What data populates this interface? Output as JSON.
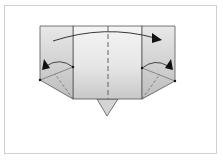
{
  "diagram": {
    "type": "origami-folding-step",
    "colors": {
      "frame": "#d0d0d0",
      "paper_light": "#f2f2f2",
      "paper_mid": "#d6d6d6",
      "paper_dark": "#c4c4c4",
      "line": "#555555",
      "arrow": "#111111"
    },
    "elements": {
      "paper_rectangle": "folded paper body",
      "center_valley_fold": "dashed vertical fold line",
      "left_crease": "left vertical crease",
      "right_crease": "right vertical crease",
      "top_arrow": "fold-over arrow left to right",
      "left_corner_arrow": "squash fold arrow left",
      "right_corner_arrow": "squash fold arrow right",
      "bottom_point": "triangular flap at bottom"
    }
  }
}
